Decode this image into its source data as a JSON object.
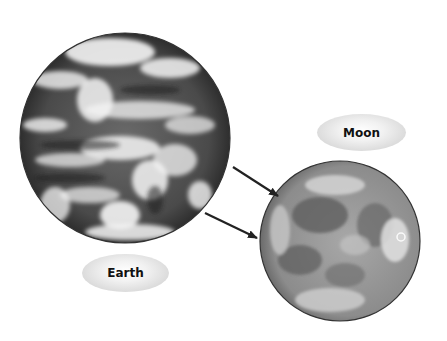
{
  "diagram": {
    "bodies": [
      {
        "name": "Earth",
        "label": "Earth",
        "description": "Satellite photograph of Earth with cloud cover (grayscale)"
      },
      {
        "name": "Moon",
        "label": "Moon",
        "description": "Photograph of the full Moon showing maria and craters (grayscale)"
      }
    ],
    "arrows": [
      {
        "from": "Earth",
        "to": "Moon",
        "direction": "right-down"
      },
      {
        "from": "Earth",
        "to": "Moon",
        "direction": "right-down"
      }
    ],
    "colors": {
      "background": "#ffffff",
      "arrow": "#222222",
      "label_fill": "#e6e6e6",
      "label_text": "#111111"
    }
  }
}
